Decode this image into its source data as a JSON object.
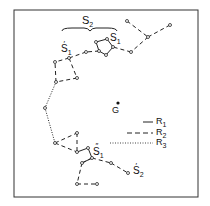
{
  "figure": {
    "labels": {
      "s2_brace": "S",
      "s2_brace_sub": "2",
      "s1": "S",
      "s1_sub": "1",
      "s1_prime": "S",
      "s1_prime_sub": "1",
      "s1_prime_mark": "′",
      "s1_double": "S",
      "s1_double_sub": "1",
      "s1_double_mark": "″",
      "s2_prime": "S",
      "s2_prime_sub": "2",
      "s2_prime_mark": "′",
      "g": "G"
    },
    "legend": [
      {
        "label": "R",
        "sub": "1",
        "style": "solid"
      },
      {
        "label": "R",
        "sub": "2",
        "style": "dashed"
      },
      {
        "label": "R",
        "sub": "3",
        "style": "dotted"
      }
    ]
  }
}
